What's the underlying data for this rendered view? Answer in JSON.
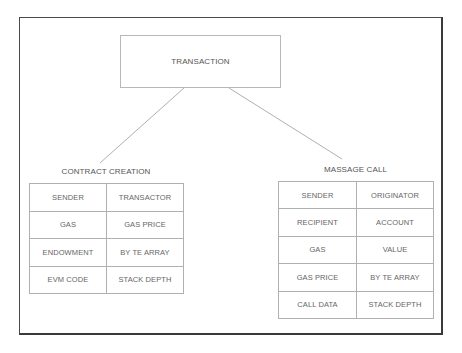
{
  "diagram": {
    "root": {
      "label": "TRANSACTION"
    },
    "branches": [
      {
        "label": "CONTRACT CREATION",
        "rows": [
          [
            "SENDER",
            "TRANSACTOR"
          ],
          [
            "GAS",
            "GAS PRICE"
          ],
          [
            "ENDOWMENT",
            "BY TE ARRAY"
          ],
          [
            "EVM CODE",
            "STACK DEPTH"
          ]
        ]
      },
      {
        "label": "MASSAGE CALL",
        "rows": [
          [
            "SENDER",
            "ORIGINATOR"
          ],
          [
            "RECIPIENT",
            "ACCOUNT"
          ],
          [
            "GAS",
            "VALUE"
          ],
          [
            "GAS PRICE",
            "BY TE ARRAY"
          ],
          [
            "CALL DATA",
            "STACK DEPTH"
          ]
        ]
      }
    ],
    "colors": {
      "frame": "#4a4a4a",
      "box_border": "#b8b8b8",
      "line": "#999999",
      "text": "#555555"
    }
  }
}
